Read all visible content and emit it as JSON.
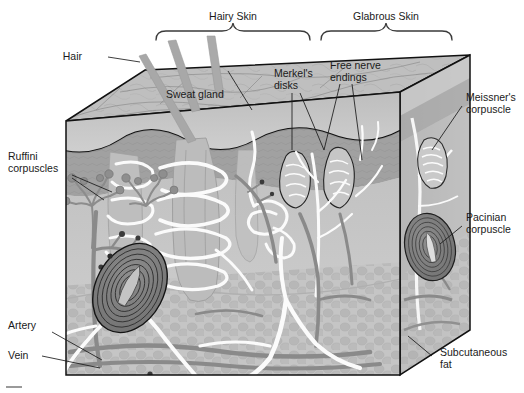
{
  "figure": {
    "type": "anatomical-diagram",
    "style": "grayscale-illustration"
  },
  "braces": [
    {
      "id": "hairy",
      "label": "Hairy Skin",
      "x_start": 155,
      "x_end": 310,
      "label_x": 233,
      "label_y": 16
    },
    {
      "id": "glabrous",
      "label": "Glabrous Skin",
      "x_start": 320,
      "x_end": 452,
      "label_x": 386,
      "label_y": 16
    }
  ],
  "labels": {
    "hair": "Hair",
    "sweat_gland": "Sweat gland",
    "merkel_line1": "Merkel's",
    "merkel_line2": "disks",
    "free_nerve_line1": "Free nerve",
    "free_nerve_line2": "endings",
    "meissner_line1": "Meissner's",
    "meissner_line2": "corpuscle",
    "ruffini_line1": "Ruffini",
    "ruffini_line2": "corpuscles",
    "pacinian_line1": "Pacinian",
    "pacinian_line2": "corpuscle",
    "artery": "Artery",
    "vein": "Vein",
    "subcutaneous_line1": "Subcutaneous",
    "subcutaneous_line2": "fat"
  },
  "structures": [
    {
      "name": "hair-shaft",
      "count": 3,
      "description": "Hair shafts projecting from hairy skin surface"
    },
    {
      "name": "hair-follicle",
      "description": "Follicle with sebaceous structures in dermis"
    },
    {
      "name": "sweat-gland",
      "description": "Coiled eccrine sweat gland with duct to surface"
    },
    {
      "name": "merkel-disks",
      "description": "Merkel's disks at epidermal-dermal junction"
    },
    {
      "name": "free-nerve-endings",
      "description": "Unencapsulated nerve endings in epidermis"
    },
    {
      "name": "meissner-corpuscle",
      "description": "Encapsulated corpuscle in dermal papillae of glabrous skin"
    },
    {
      "name": "ruffini-corpuscle",
      "count": 2,
      "description": "Branching spindle endings in dermis"
    },
    {
      "name": "pacinian-corpuscle",
      "count": 2,
      "description": "Onion-layered lamellar corpuscle in subcutaneous fat"
    },
    {
      "name": "artery",
      "description": "Dark-toned vessel entering at lower left"
    },
    {
      "name": "vein",
      "description": "Dark-toned vessel entering at lower left"
    },
    {
      "name": "subcutaneous-fat",
      "description": "Adipose tissue layer at base of block"
    }
  ],
  "colors": {
    "outline": "#111111",
    "text": "#1a1a1a",
    "brace": "#3a3a3a",
    "epidermis_top": "#b9b9b9",
    "epidermis_mid": "#a2a2a2",
    "dermis": "#9a9a9a",
    "dermis_light": "#c7c7c7",
    "fat": "#bdbdbd",
    "nerve_white": "#fbfbfb",
    "vessel_dark": "#7a7a7a",
    "vessel_darker": "#5e5e5e",
    "background": "#ffffff"
  }
}
